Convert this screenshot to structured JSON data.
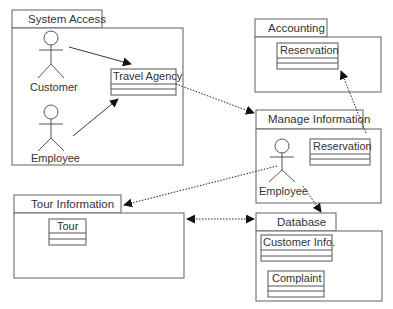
{
  "packages": {
    "system_access": {
      "title": "System Access",
      "actors": [
        "Customer",
        "Employee"
      ],
      "classes": [
        "Travel Agency"
      ]
    },
    "accounting": {
      "title": "Accounting",
      "classes": [
        "Reservation"
      ]
    },
    "manage_information": {
      "title": "Manage Information",
      "actors": [
        "Employee"
      ],
      "classes": [
        "Reservation"
      ]
    },
    "tour_information": {
      "title": "Tour Information",
      "classes": [
        "Tour"
      ]
    },
    "database": {
      "title": "Database",
      "classes": [
        "Customer Info.",
        "Complaint"
      ]
    }
  },
  "relationships": [
    {
      "from": "Customer",
      "to": "Travel Agency",
      "style": "solid"
    },
    {
      "from": "Employee",
      "to": "Travel Agency",
      "style": "solid"
    },
    {
      "from": "Travel Agency",
      "to": "Manage Information",
      "style": "dotted"
    },
    {
      "from": "Manage Information",
      "to": "Accounting.Reservation",
      "style": "dotted"
    },
    {
      "from": "Manage Information.Employee",
      "to": "Tour Information",
      "style": "dotted"
    },
    {
      "from": "Manage Information.Employee",
      "to": "Database",
      "style": "dotted"
    },
    {
      "from": "Tour Information",
      "to": "Database",
      "style": "dotted",
      "bidirectional": true
    }
  ],
  "colors": {
    "line": "#6e6e6e",
    "arrowhead": "#111111",
    "text": "#333333",
    "background": "#ffffff"
  }
}
